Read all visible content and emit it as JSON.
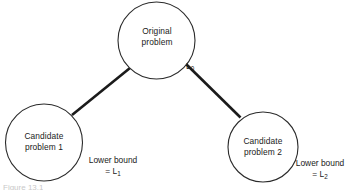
{
  "figure": {
    "caption": "Figure 13.1",
    "background_color": "#ffffff",
    "stroke_color": "#2b2b2b",
    "branch_color": "#1b1b1b"
  },
  "nodes": [
    {
      "id": "root",
      "label_line_1": "Original",
      "label_line_2": "problem",
      "cx": 156.5,
      "cy": 40.5,
      "r": 38.5
    },
    {
      "id": "candidate-1",
      "label_line_1": "Candidate",
      "label_line_2": "problem 1",
      "cx": 44,
      "cy": 142.5,
      "r": 38.5
    },
    {
      "id": "candidate-2",
      "label_line_1": "Candidate",
      "label_line_2": "problem 2",
      "cx": 263,
      "cy": 147,
      "r": 35
    }
  ],
  "edges": [
    {
      "id": "root-to-candidate-1",
      "from": "root",
      "to": "candidate-1",
      "x1": 130,
      "y1": 68,
      "x2": 72,
      "y2": 115
    },
    {
      "id": "root-to-candidate-2",
      "from": "root",
      "to": "candidate-2",
      "x1": 185,
      "y1": 63,
      "x2": 240.5,
      "y2": 117.5
    }
  ],
  "edge_labels": {
    "root_bound_symbol": "L",
    "root_bound_subscript": "0"
  },
  "bounds": {
    "left": {
      "text_line_1": "Lower bound",
      "equals_symbol": "=",
      "bound_symbol": "L",
      "bound_subscript": "1"
    },
    "right": {
      "text_line_1": "Lower bound",
      "equals_symbol": "=",
      "bound_symbol": "L",
      "bound_subscript": "2"
    }
  }
}
